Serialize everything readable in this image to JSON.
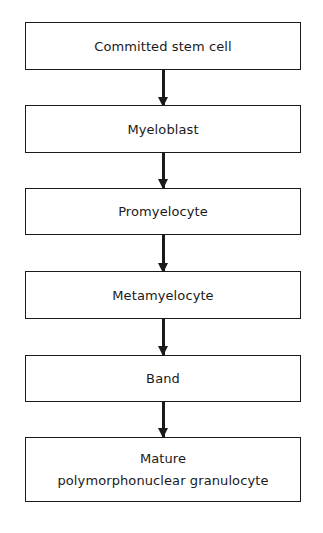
{
  "diagram": {
    "type": "flowchart",
    "direction": "top-to-bottom",
    "nodes": [
      {
        "id": "committed-stem-cell",
        "lines": [
          "Committed stem cell"
        ]
      },
      {
        "id": "myeloblast",
        "lines": [
          "Myeloblast"
        ]
      },
      {
        "id": "promyelocyte",
        "lines": [
          "Promyelocyte"
        ]
      },
      {
        "id": "metamyelocyte",
        "lines": [
          "Metamyelocyte"
        ]
      },
      {
        "id": "band",
        "lines": [
          "Band"
        ]
      },
      {
        "id": "mature-pmn",
        "lines": [
          "Mature",
          "polymorphonuclear granulocyte"
        ]
      }
    ],
    "edges": [
      {
        "from": "committed-stem-cell",
        "to": "myeloblast"
      },
      {
        "from": "myeloblast",
        "to": "promyelocyte"
      },
      {
        "from": "promyelocyte",
        "to": "metamyelocyte"
      },
      {
        "from": "metamyelocyte",
        "to": "band"
      },
      {
        "from": "band",
        "to": "mature-pmn"
      }
    ],
    "colors": {
      "line": "#1a1a1a",
      "background": "#ffffff",
      "text": "#1a1a1a"
    }
  }
}
